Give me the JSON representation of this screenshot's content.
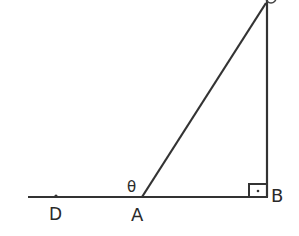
{
  "diagram": {
    "type": "geometry-right-triangle",
    "stroke_color": "#333333",
    "background": "#ffffff",
    "points": {
      "D": {
        "label": "D",
        "x": 56,
        "y": 197
      },
      "A": {
        "label": "A",
        "x": 142,
        "y": 197
      },
      "B": {
        "label": "B",
        "x": 267,
        "y": 197
      },
      "C": {
        "label": "C",
        "x": 267,
        "y": 2
      }
    },
    "angle_label": "θ",
    "right_angle_at": "B",
    "segments": [
      "D-line-B",
      "A-C",
      "B-C"
    ]
  }
}
